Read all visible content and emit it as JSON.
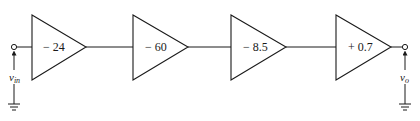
{
  "diagram": {
    "type": "cascaded amplifier block diagram",
    "input": {
      "label": "v",
      "subscript": "in"
    },
    "output": {
      "label": "v",
      "subscript": "o"
    },
    "stages": [
      {
        "gain": "− 24"
      },
      {
        "gain": "− 60"
      },
      {
        "gain": "− 8.5"
      },
      {
        "gain": "+ 0.7"
      }
    ]
  }
}
